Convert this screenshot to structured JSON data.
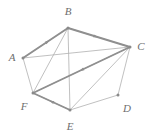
{
  "figure": {
    "kind": "directed-graph-diagram",
    "width": 149,
    "height": 140,
    "background_color": "#ffffff",
    "stroke_color_thin": "#b0b0b0",
    "stroke_color_thick": "#8f8f8f",
    "label_color": "#6e6e6e",
    "vertex_dot_color": "#8a8a8a"
  },
  "vertices": [
    {
      "id": "A",
      "label": "A",
      "x": 23,
      "y": 58,
      "label_x": 12,
      "label_y": 57
    },
    {
      "id": "B",
      "label": "B",
      "x": 68,
      "y": 28,
      "label_x": 68,
      "label_y": 11
    },
    {
      "id": "C",
      "label": "C",
      "x": 130,
      "y": 47,
      "label_x": 141,
      "label_y": 46
    },
    {
      "id": "D",
      "label": "D",
      "x": 118,
      "y": 95,
      "label_x": 127,
      "label_y": 108
    },
    {
      "id": "E",
      "label": "E",
      "x": 70,
      "y": 110,
      "label_x": 70,
      "label_y": 126
    },
    {
      "id": "F",
      "label": "F",
      "x": 33,
      "y": 93,
      "label_x": 24,
      "label_y": 106
    }
  ],
  "edges_thin": [
    {
      "from": "A",
      "to": "C",
      "directed": false
    },
    {
      "from": "A",
      "to": "F",
      "directed": false
    },
    {
      "from": "A",
      "to": "B",
      "directed": false
    },
    {
      "from": "B",
      "to": "F",
      "directed": false
    },
    {
      "from": "B",
      "to": "E",
      "directed": false
    },
    {
      "from": "B",
      "to": "C",
      "directed": false
    },
    {
      "from": "C",
      "to": "E",
      "directed": false
    },
    {
      "from": "C",
      "to": "F",
      "directed": false
    },
    {
      "from": "C",
      "to": "D",
      "directed": false
    },
    {
      "from": "D",
      "to": "E",
      "directed": false
    },
    {
      "from": "E",
      "to": "F",
      "directed": false
    }
  ],
  "edges_thick_directed": [
    {
      "from": "A",
      "to": "B",
      "arrow_at": 0.55
    },
    {
      "from": "B",
      "to": "C",
      "arrow_at": 0.45
    },
    {
      "from": "C",
      "to": "F",
      "arrow_at": 0.5
    },
    {
      "from": "E",
      "to": "F",
      "arrow_at": 0.5
    }
  ]
}
